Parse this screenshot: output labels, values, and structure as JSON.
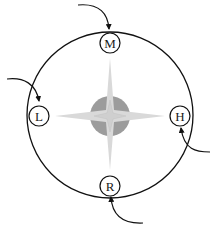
{
  "diagram": {
    "type": "compass-rose-cycle",
    "colors": {
      "line": "#111111",
      "hub": "#9c9c9c",
      "star": "#d9d9d9",
      "background": "#ffffff"
    },
    "nodes": [
      {
        "id": "M",
        "label": "M",
        "position": "top"
      },
      {
        "id": "L",
        "label": "L",
        "position": "left"
      },
      {
        "id": "H",
        "label": "H",
        "position": "right"
      },
      {
        "id": "R",
        "label": "R",
        "position": "bottom"
      }
    ],
    "incoming_arrows": [
      {
        "target": "M",
        "from": "top-left"
      },
      {
        "target": "L",
        "from": "left"
      },
      {
        "target": "H",
        "from": "bottom-right"
      },
      {
        "target": "R",
        "from": "bottom-right"
      }
    ]
  }
}
